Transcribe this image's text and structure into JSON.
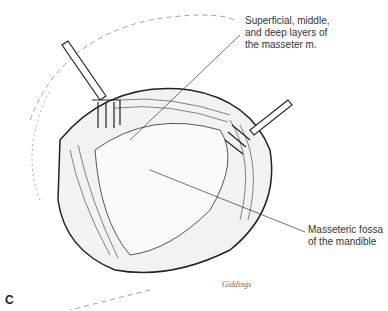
{
  "labels": {
    "masseter_layers": [
      "Superficial, middle,",
      "and deep layers of",
      "the masseter m."
    ],
    "masseteric_fossa": [
      "Masseteric fossa",
      "of the mandible"
    ],
    "panel": "C",
    "signature": "Giddings"
  }
}
